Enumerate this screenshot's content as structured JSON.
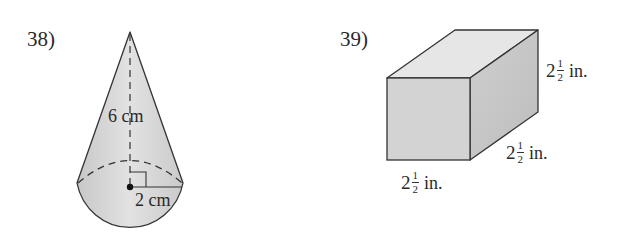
{
  "problems": [
    {
      "number_label": "38)",
      "shape": "cone",
      "height_label": "6 cm",
      "radius_label": "2 cm"
    },
    {
      "number_label": "39)",
      "shape": "rectangular-prism",
      "dimensions": [
        {
          "position": "height",
          "whole": "2",
          "numerator": "1",
          "denominator": "2",
          "unit": "in."
        },
        {
          "position": "depth",
          "whole": "2",
          "numerator": "1",
          "denominator": "2",
          "unit": "in."
        },
        {
          "position": "width",
          "whole": "2",
          "numerator": "1",
          "denominator": "2",
          "unit": "in."
        }
      ]
    }
  ],
  "colors": {
    "stroke": "#333333",
    "cone_fill": "#d4d4d4",
    "box_front": "#d2d2d2",
    "box_top": "#e6e6e6",
    "box_side": "#c4c4c4"
  }
}
